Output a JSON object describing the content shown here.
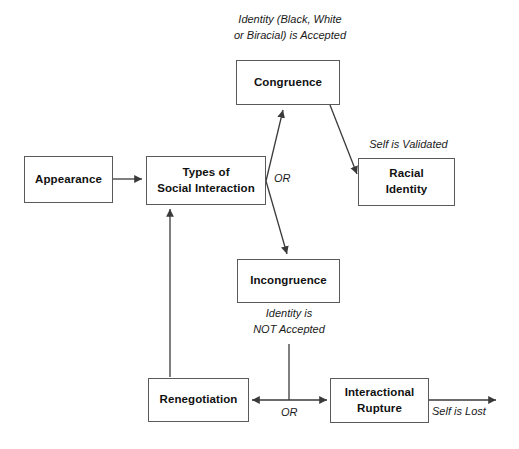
{
  "diagram": {
    "background_color": "#ffffff",
    "line_color": "#3a3a3a",
    "box_border_color": "#5a5a5a",
    "text_color": "#111111",
    "nodes": [
      {
        "id": "appearance",
        "label": "Appearance"
      },
      {
        "id": "types-of-social-interaction",
        "label": "Types of\nSocial Interaction"
      },
      {
        "id": "congruence",
        "label": "Congruence"
      },
      {
        "id": "racial-identity",
        "label": "Racial\nIdentity"
      },
      {
        "id": "incongruence",
        "label": "Incongruence"
      },
      {
        "id": "renegotiation",
        "label": "Renegotiation"
      },
      {
        "id": "interactional-rupture",
        "label": "Interactional\nRupture"
      }
    ],
    "edge_labels": [
      {
        "id": "identity-accepted",
        "text": "Identity (Black, White\nor Biracial) is Accepted"
      },
      {
        "id": "self-is-validated",
        "text": "Self is Validated"
      },
      {
        "id": "identity-not-accepted",
        "text": "Identity is\nNOT Accepted"
      },
      {
        "id": "self-is-lost",
        "text": "Self is Lost"
      }
    ],
    "or_labels": [
      {
        "id": "or-branch-congruence",
        "text": "OR"
      },
      {
        "id": "or-branch-rupture",
        "text": "OR"
      }
    ]
  }
}
